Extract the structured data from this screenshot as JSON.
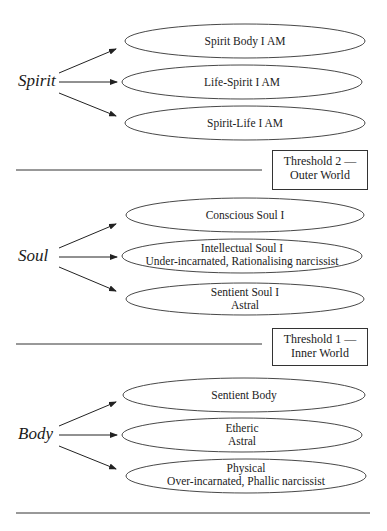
{
  "diagram": {
    "groups": [
      {
        "label": "Spirit",
        "nodes": [
          {
            "line1": "Spirit Body I AM",
            "line2": ""
          },
          {
            "line1": "Life-Spirit I AM",
            "line2": ""
          },
          {
            "line1": "Spirit-Life I AM",
            "line2": ""
          }
        ]
      },
      {
        "label": "Soul",
        "nodes": [
          {
            "line1": "Conscious Soul I",
            "line2": ""
          },
          {
            "line1": "Intellectual Soul I",
            "line2": "Under-incarnated, Rationalising narcissist"
          },
          {
            "line1": "Sentient Soul I",
            "line2": "Astral"
          }
        ]
      },
      {
        "label": "Body",
        "nodes": [
          {
            "line1": "Sentient Body",
            "line2": ""
          },
          {
            "line1": "Etheric",
            "line2": "Astral"
          },
          {
            "line1": "Physical",
            "line2": "Over-incarnated, Phallic narcissist"
          }
        ]
      }
    ],
    "thresholds": [
      {
        "line1": "Threshold 2 —",
        "line2": "Outer World"
      },
      {
        "line1": "Threshold 1 —",
        "line2": "Inner World"
      }
    ],
    "colors": {
      "stroke": "#333333",
      "text": "#222222",
      "background": "#ffffff"
    }
  }
}
